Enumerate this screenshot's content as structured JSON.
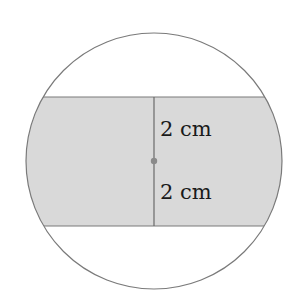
{
  "diagram": {
    "circle": {
      "cx": 154,
      "cy": 161,
      "r": 128,
      "stroke": "#7a7a7a"
    },
    "band": {
      "top": 97,
      "bottom": 226,
      "fill": "#d9d9d9",
      "stroke": "#7a7a7a"
    },
    "center_point": {
      "x": 154,
      "y": 161,
      "color": "#8a8a8a"
    },
    "labels": {
      "upper": "2 cm",
      "lower": "2 cm"
    }
  }
}
